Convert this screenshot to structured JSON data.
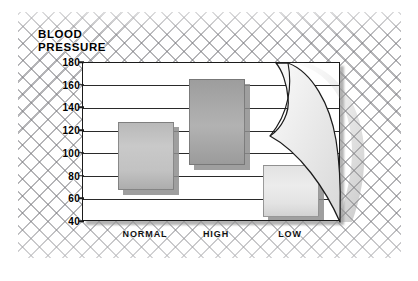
{
  "chart_data": {
    "type": "bar",
    "title_line1": "BLOOD",
    "title_line2": "PRESSURE",
    "xlabel": "",
    "ylabel": "BLOOD PRESSURE",
    "ylim": [
      40,
      180
    ],
    "yticks": [
      180,
      160,
      140,
      120,
      100,
      80,
      60,
      40
    ],
    "grid": true,
    "legend": "none",
    "categories": [
      "NORMAL",
      "HIGH",
      "LOW"
    ],
    "bar_style": "floating range bars (low-to-high)",
    "series": [
      {
        "name": "diastolic (bar bottom)",
        "values": [
          68,
          90,
          44
        ]
      },
      {
        "name": "systolic (bar top)",
        "values": [
          128,
          166,
          90
        ]
      }
    ],
    "ranges": [
      {
        "category": "NORMAL",
        "low": 68,
        "high": 128,
        "shade": "#c2c2c2"
      },
      {
        "category": "HIGH",
        "low": 90,
        "high": 166,
        "shade": "#a6a6a6"
      },
      {
        "category": "LOW",
        "low": 44,
        "high": 90,
        "shade": "#e6e6e6"
      }
    ],
    "annotations": [
      "page-curl effect at top-right corner of plot panel"
    ]
  },
  "figure": {
    "background_pattern": "diagonal cross-hatch lattice",
    "panel_background": "#ffffff",
    "panel_border": "#1b1b1b",
    "gridline_color": "#2a2a2a"
  }
}
